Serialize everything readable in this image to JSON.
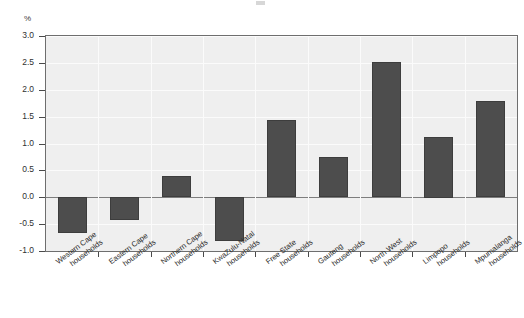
{
  "chart_data": {
    "type": "bar",
    "title": "",
    "subtitle": "",
    "xlabel": "",
    "ylabel": "%",
    "unit_label": "%",
    "ylim": [
      -1.0,
      3.0
    ],
    "ytick_step": 0.5,
    "ytick_labels": [
      "3.0",
      "2.5",
      "2.0",
      "1.5",
      "1.0",
      "0.5",
      "0.0",
      "-0.5",
      "-1.0"
    ],
    "ytick_values": [
      3.0,
      2.5,
      2.0,
      1.5,
      1.0,
      0.5,
      0.0,
      -0.5,
      -1.0
    ],
    "grid": true,
    "legend": "none",
    "zero_line": 0.0,
    "bar_color": "#4d4d4d",
    "plot_background": "#efefef",
    "gridline_color": "#fbfbfb",
    "categories": [
      "Western Cape households",
      "Eastern Cape households",
      "Northern Cape households",
      "KwaZulu-Natal households",
      "Free State households",
      "Gauteng households",
      "North West households",
      "Limpopo households",
      "Mpumalanga households"
    ],
    "category_lines": [
      [
        "Western Cape",
        "households"
      ],
      [
        "Eastern Cape",
        "households"
      ],
      [
        "Northern Cape",
        "households"
      ],
      [
        "KwaZulu-Natal",
        "households"
      ],
      [
        "Free State",
        "households"
      ],
      [
        "Gauteng",
        "households"
      ],
      [
        "North West",
        "households"
      ],
      [
        "Limpopo",
        "households"
      ],
      [
        "Mpumalanga",
        "households"
      ]
    ],
    "values": [
      -0.67,
      -0.42,
      0.39,
      -0.81,
      1.43,
      0.74,
      2.52,
      1.13,
      1.79
    ]
  }
}
